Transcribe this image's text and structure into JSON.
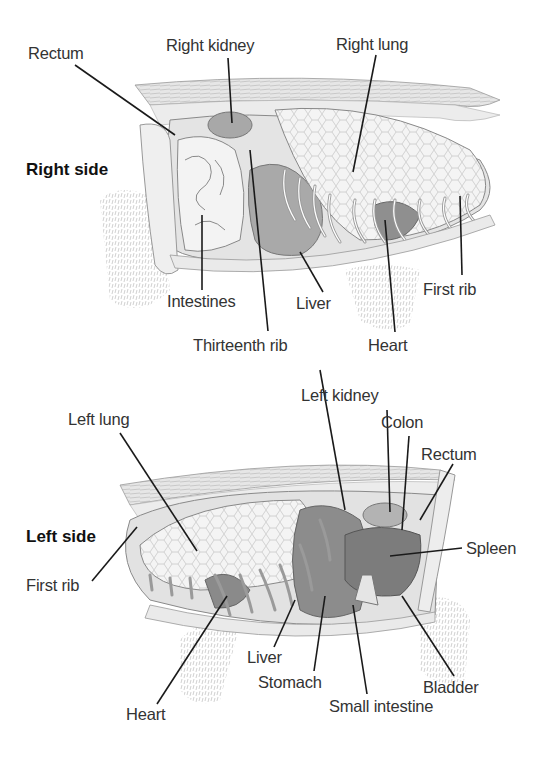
{
  "figure": {
    "panels": [
      {
        "title": "Right side",
        "labels": [
          {
            "text": "Rectum"
          },
          {
            "text": "Right kidney"
          },
          {
            "text": "Right lung"
          },
          {
            "text": "Intestines"
          },
          {
            "text": "Liver"
          },
          {
            "text": "First rib"
          },
          {
            "text": "Thirteenth rib"
          },
          {
            "text": "Heart"
          }
        ]
      },
      {
        "title": "Left side",
        "labels": [
          {
            "text": "Left lung"
          },
          {
            "text": "Left kidney"
          },
          {
            "text": "Colon"
          },
          {
            "text": "Rectum"
          },
          {
            "text": "Spleen"
          },
          {
            "text": "First rib"
          },
          {
            "text": "Liver"
          },
          {
            "text": "Stomach"
          },
          {
            "text": "Small intestine"
          },
          {
            "text": "Bladder"
          },
          {
            "text": "Heart"
          }
        ]
      }
    ],
    "colors": {
      "line": "#1a1a1a",
      "organ_light": "#ececec",
      "organ_mid": "#b9b9b9",
      "organ_dark": "#7a7a7a",
      "fur": "#cfcfcf"
    }
  }
}
